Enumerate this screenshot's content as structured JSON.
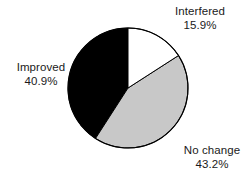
{
  "chart_data": {
    "type": "pie",
    "title": "",
    "categories": [
      "Interfered",
      "No change",
      "Improved"
    ],
    "values": [
      15.9,
      43.2,
      40.9
    ],
    "value_unit": "%",
    "slices": [
      {
        "label": "Interfered",
        "value": 15.9,
        "value_text": "15.9%",
        "color": "#ffffff",
        "start_angle_deg": 0,
        "end_angle_deg": 57.24
      },
      {
        "label": "No change",
        "value": 43.2,
        "value_text": "43.2%",
        "color": "#c8c8c8",
        "start_angle_deg": 57.24,
        "end_angle_deg": 212.76
      },
      {
        "label": "Improved",
        "value": 40.9,
        "value_text": "40.9%",
        "color": "#000000",
        "start_angle_deg": 212.76,
        "end_angle_deg": 360
      }
    ],
    "start_angle_deg": 0,
    "direction": "clockwise",
    "legend": "none",
    "labels_position": "outside",
    "outline_color": "#000000",
    "background": "#ffffff",
    "total": 100.0
  },
  "labels": {
    "interfered": {
      "name": "Interfered",
      "percent": "15.9%"
    },
    "no_change": {
      "name": "No change",
      "percent": "43.2%"
    },
    "improved": {
      "name": "Improved",
      "percent": "40.9%"
    }
  }
}
